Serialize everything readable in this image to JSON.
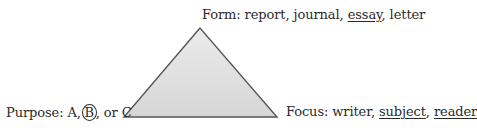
{
  "diagram": {
    "shape": "triangle",
    "fill_color": "#dcdcdc",
    "stroke_color": "#555555",
    "vertices": {
      "top": {
        "label": "Form",
        "options": [
          "report",
          "journal",
          "essay",
          "letter"
        ],
        "underlined": [
          "essay"
        ]
      },
      "bottom_left": {
        "label": "Purpose",
        "options": [
          "A",
          "B",
          "C"
        ],
        "circled": [
          "B"
        ]
      },
      "bottom_right": {
        "label": "Focus",
        "options": [
          "writer",
          "subject",
          "reader"
        ],
        "underlined": [
          "subject",
          "reader"
        ]
      }
    }
  },
  "text": {
    "form_prefix": "Form: report, journal, ",
    "form_essay": "essay",
    "form_suffix": ", letter",
    "purpose_prefix": "Purpose: A,",
    "purpose_b": "B",
    "purpose_suffix": ", or C",
    "focus_prefix": "Focus: writer, ",
    "focus_subject": "subject",
    "focus_sep": ", ",
    "focus_reader": "reader"
  }
}
